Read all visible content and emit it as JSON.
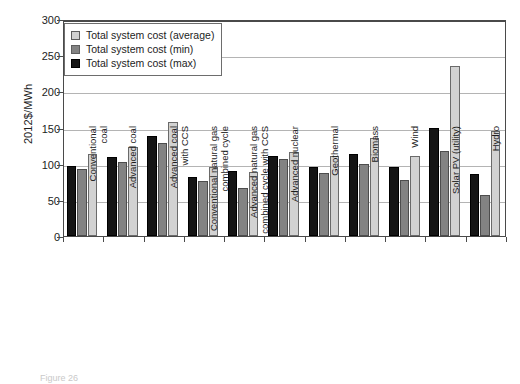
{
  "chart_data": {
    "type": "bar",
    "title": "",
    "xlabel": "",
    "ylabel": "2012$/MWh",
    "ylim": [
      0,
      300
    ],
    "yticks": [
      0,
      50,
      100,
      150,
      200,
      250,
      300
    ],
    "grid": true,
    "legend_position": "top-left",
    "categories": [
      "Conventional\ncoal",
      "Advanced coal",
      "Advanced coal\nwith CCS",
      "Conventional natural gas\ncombined cycle",
      "Advanced natural gas\ncombined cycle with CCS",
      "Advanced nuclear",
      "Geothermal",
      "Biomass",
      "Wind",
      "Solar PV (utility)",
      "Hydro"
    ],
    "series": [
      {
        "name": "Total system cost (max)",
        "color": "#151515",
        "values": [
          97,
          109,
          138,
          81,
          90,
          111,
          95,
          114,
          96,
          150,
          86
        ]
      },
      {
        "name": "Total system cost (min)",
        "color": "#838383",
        "values": [
          92,
          102,
          128,
          76,
          67,
          106,
          87,
          99,
          77,
          117,
          57
        ]
      },
      {
        "name": "Total system cost (average)",
        "color": "#d2d2d2",
        "values": [
          114,
          123,
          157,
          95,
          88,
          116,
          111,
          135,
          111,
          235,
          145
        ]
      }
    ],
    "series_draw_order": [
      "max",
      "min",
      "avg"
    ]
  },
  "legend": {
    "items": [
      {
        "label": "Total system cost (average)",
        "key": "avg"
      },
      {
        "label": "Total system cost (min)",
        "key": "min"
      },
      {
        "label": "Total system cost (max)",
        "key": "max"
      }
    ]
  },
  "axis": {
    "y_title": "2012$/MWh",
    "y_tick_labels": [
      "300",
      "250",
      "200",
      "150",
      "100",
      "50",
      "0"
    ]
  },
  "caption": {
    "text": "Figure 26"
  }
}
